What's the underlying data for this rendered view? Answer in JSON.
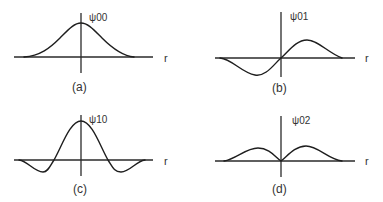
{
  "figure": {
    "panels": [
      {
        "id": "a",
        "function_label": "ψ00",
        "axis_label": "r",
        "caption": "(a)",
        "description": "Gaussian-like single positive peak centered at r=0"
      },
      {
        "id": "b",
        "function_label": "ψ01",
        "axis_label": "r",
        "caption": "(b)",
        "description": "Odd function: negative lobe left, positive lobe right, zero at origin"
      },
      {
        "id": "c",
        "function_label": "ψ10",
        "axis_label": "r",
        "caption": "(c)",
        "description": "Central positive peak with two negative side lobes"
      },
      {
        "id": "d",
        "function_label": "ψ02",
        "axis_label": "r",
        "caption": "(d)",
        "description": "Two symmetric positive lobes, zero at origin"
      }
    ]
  }
}
